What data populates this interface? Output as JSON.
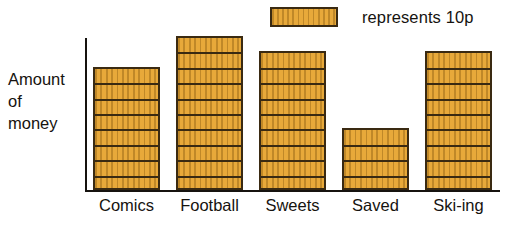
{
  "chart_data": {
    "type": "bar",
    "title": "",
    "subtitle": "",
    "xlabel": "",
    "ylabel": "Amount of money",
    "ylabel_lines": [
      "Amount",
      "of",
      "money"
    ],
    "categories": [
      "Comics",
      "Football",
      "Sweets",
      "Saved",
      "Ski-ing"
    ],
    "values": [
      80,
      90,
      80,
      40,
      80
    ],
    "unit": "p",
    "unit_per_segment": 10,
    "segments": [
      8,
      10,
      9,
      4,
      9
    ],
    "value_labels": [
      "80p",
      "100p",
      "90p",
      "40p",
      "90p"
    ],
    "ylim": [
      0,
      100
    ],
    "grid": false,
    "legend_position": "top-right",
    "legend": [
      {
        "swatch": "striped-gold-block",
        "label": "represents 10p"
      }
    ],
    "annotations": [],
    "series": [
      {
        "name": "Amount of money",
        "values": [
          80,
          100,
          90,
          40,
          90
        ]
      }
    ]
  },
  "legend": {
    "text": "represents 10p",
    "swatch_name": "legend-swatch"
  },
  "axes": {
    "y_title_lines": [
      "Amount",
      "of",
      "money"
    ]
  },
  "colors": {
    "bar_fill": "#e8a93a",
    "bar_stripe": "#c08828",
    "bar_border": "#3a2a12",
    "axis": "#16130f",
    "text": "#16130f",
    "background": "#ffffff"
  }
}
